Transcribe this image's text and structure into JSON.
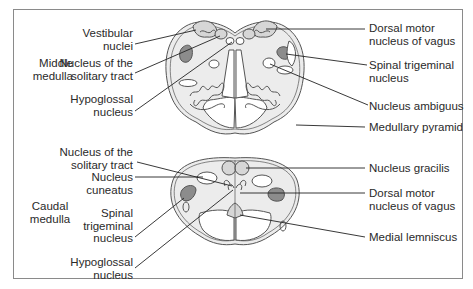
{
  "figure": {
    "sections": [
      {
        "title": "Middle\nmedulla",
        "labels_left": [
          {
            "text": "Vestibular\nnuclei"
          },
          {
            "text": "Nucleus of the\nsolitary tract"
          },
          {
            "text": "Hypoglossal\nnucleus"
          }
        ],
        "labels_right": [
          {
            "text": "Dorsal motor\nnucleus of vagus"
          },
          {
            "text": "Spinal trigeminal\nnucleus"
          },
          {
            "text": "Nucleus ambiguus"
          },
          {
            "text": "Medullary pyramid"
          }
        ]
      },
      {
        "title": "Caudal\nmedulla",
        "labels_left": [
          {
            "text": "Nucleus of the\nsolitary tract"
          },
          {
            "text": "Nucleus\ncuneatus"
          },
          {
            "text": "Spinal\ntrigeminal\nnucleus"
          },
          {
            "text": "Hypoglossal\nnucleus"
          }
        ],
        "labels_right": [
          {
            "text": "Nucleus gracilis"
          },
          {
            "text": "Dorsal motor\nnucleus of vagus"
          },
          {
            "text": "Medial lemniscus"
          }
        ]
      }
    ],
    "colors": {
      "tissue": "#ececec",
      "nucleus_light": "#d6d6d6",
      "nucleus_dark": "#8c8c8c",
      "outline": "#555555",
      "white_matter": "#ffffff",
      "frame": "#8a8a8a"
    }
  }
}
